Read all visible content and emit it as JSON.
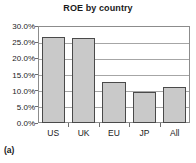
{
  "figure": {
    "caption": "(a)"
  },
  "chart_data": {
    "type": "bar",
    "title": "ROE by country",
    "xlabel": "",
    "ylabel": "",
    "categories": [
      "US",
      "UK",
      "EU",
      "JP",
      "All"
    ],
    "values": [
      26.6,
      26.2,
      12.8,
      9.5,
      11.2
    ],
    "value_labels": [
      "26.6%",
      "26.2%",
      "12.8%",
      "9.5%",
      "11.2%"
    ],
    "ylim": [
      0,
      30
    ],
    "ytick_values": [
      30,
      25,
      20,
      15,
      10,
      5,
      0
    ],
    "ytick_labels": [
      "30.0%",
      "25.0%",
      "20.0%",
      "15.0%",
      "10.0%",
      "5.0%",
      "0.0%"
    ],
    "grid": true,
    "legend": false,
    "legend_position": "none",
    "series_name": "ROE",
    "bar_fill_color": "#c9c9c9",
    "bar_border_color": "#4a4a4a",
    "grid_color": "#a6a6a6",
    "axis_color": "#8c8c8c",
    "text_color": "#1a1a1a"
  }
}
